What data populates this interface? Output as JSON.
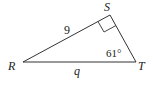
{
  "diagram": {
    "type": "right-triangle",
    "vertices": {
      "R": {
        "label": "R"
      },
      "S": {
        "label": "S"
      },
      "T": {
        "label": "T"
      }
    },
    "sides": {
      "RS": {
        "label": "9"
      },
      "RT": {
        "label": "q"
      }
    },
    "angles": {
      "T": {
        "label": "61°"
      },
      "S": {
        "label": "right-angle"
      }
    },
    "colors": {
      "stroke": "#333333",
      "text": "#222222"
    }
  }
}
